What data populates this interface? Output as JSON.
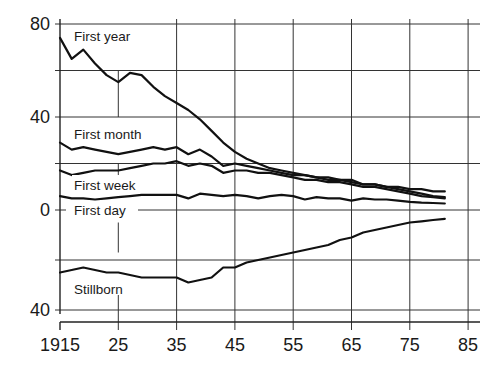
{
  "chart_data": {
    "type": "line",
    "title": "",
    "xlabel": "",
    "ylabel": "",
    "x_tick_labels": [
      "1915",
      "25",
      "35",
      "45",
      "55",
      "65",
      "75",
      "85"
    ],
    "x_ticks": [
      1915,
      1925,
      1935,
      1945,
      1955,
      1965,
      1975,
      1985
    ],
    "y_tick_labels": [
      {
        "value": 80,
        "label": "80"
      },
      {
        "value": 40,
        "label": "40"
      },
      {
        "value": 0,
        "label": "0"
      },
      {
        "value": -40,
        "label": "40"
      }
    ],
    "y_gridlines": [
      80,
      60,
      40,
      20,
      0,
      -20,
      -40
    ],
    "ylim": [
      -44,
      80
    ],
    "xlim": [
      1915,
      1987
    ],
    "grid": true,
    "legend": "inline labels",
    "note": "Stillborn series plotted downward below zero (axis label 40 below 0 denotes 40 in the inverted lower panel).",
    "x": [
      1915,
      1917,
      1919,
      1921,
      1923,
      1925,
      1927,
      1929,
      1931,
      1933,
      1935,
      1937,
      1939,
      1941,
      1943,
      1945,
      1947,
      1949,
      1951,
      1953,
      1955,
      1957,
      1959,
      1961,
      1963,
      1965,
      1967,
      1969,
      1971,
      1973,
      1975,
      1977,
      1979,
      1981
    ],
    "series": [
      {
        "name": "First year",
        "values": [
          74,
          65,
          69,
          63,
          58,
          55,
          59,
          58,
          53,
          49,
          46,
          43,
          39,
          34,
          29,
          25,
          22,
          20,
          18,
          17,
          16,
          15,
          14,
          13,
          13,
          12,
          11,
          11,
          10,
          10,
          9,
          9,
          8,
          8
        ]
      },
      {
        "name": "First month",
        "values": [
          29,
          26,
          27,
          26,
          25,
          24,
          25,
          26,
          27,
          26,
          27,
          24,
          26,
          23,
          19,
          20,
          19,
          18,
          17,
          16,
          15,
          15,
          14,
          14,
          13,
          13,
          11,
          11,
          10,
          9,
          8,
          7,
          6,
          5.5
        ]
      },
      {
        "name": "First week",
        "values": [
          17,
          15,
          16,
          17,
          17,
          17,
          18,
          19,
          20,
          20,
          21,
          19,
          20,
          19,
          16,
          17,
          17,
          16,
          16,
          15,
          14,
          13,
          13,
          12,
          12,
          11,
          10,
          10,
          9,
          8,
          7,
          6,
          5.5,
          5
        ]
      },
      {
        "name": "First day",
        "values": [
          6,
          5,
          5,
          4.5,
          5,
          5.5,
          6,
          6.5,
          6.5,
          6.5,
          6.5,
          5,
          7,
          6.5,
          6,
          6.5,
          6,
          5,
          6,
          6.5,
          6,
          4.5,
          5.5,
          5,
          5,
          4,
          5,
          4.5,
          4.5,
          4,
          3.5,
          3.2,
          3,
          2.8
        ]
      },
      {
        "name": "Stillborn",
        "values": [
          25,
          24,
          23,
          24,
          25,
          25,
          26,
          27,
          27,
          27,
          27,
          29,
          28,
          27,
          23,
          23,
          21,
          20,
          19,
          18,
          17,
          16,
          15,
          14,
          12,
          11,
          9,
          8,
          7,
          6,
          5,
          4.5,
          4,
          3.5
        ]
      }
    ]
  },
  "labels": {
    "first_year": "First year",
    "first_month": "First month",
    "first_week": "First week",
    "first_day": "First day",
    "stillborn": "Stillborn"
  }
}
